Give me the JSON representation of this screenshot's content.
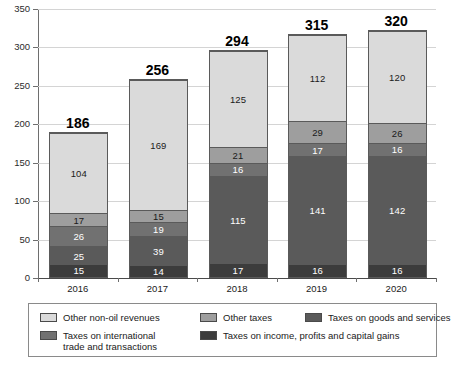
{
  "chart_data": {
    "type": "bar",
    "title": "",
    "subtitle": "",
    "xlabel": "",
    "ylabel": "",
    "stacked": true,
    "grid": true,
    "legend_position": "bottom",
    "ylim": [
      0,
      350
    ],
    "ytick_step": 50,
    "yticks": [
      "0",
      "50",
      "100",
      "150",
      "200",
      "250",
      "300",
      "350"
    ],
    "categories": [
      "2016",
      "2017",
      "2018",
      "2019",
      "2020"
    ],
    "totals": [
      "186",
      "256",
      "294",
      "315",
      "320"
    ],
    "series": [
      {
        "name": "Taxes on income, profits and capital gains",
        "color": "#3c3c3c",
        "label_color": "#ffffff",
        "values": [
          15,
          14,
          17,
          16,
          16
        ],
        "labels": [
          "15",
          "14",
          "17",
          "16",
          "16"
        ]
      },
      {
        "name": "Taxes on goods and services",
        "color": "#5a5a5a",
        "label_color": "#ffffff",
        "values": [
          25,
          39,
          115,
          141,
          142
        ],
        "labels": [
          "25",
          "39",
          "115",
          "141",
          "142"
        ]
      },
      {
        "name": "Taxes on international trade and transactions",
        "color": "#717171",
        "label_color": "#ffffff",
        "values": [
          26,
          19,
          16,
          17,
          16
        ],
        "labels": [
          "26",
          "19",
          "16",
          "17",
          "16"
        ]
      },
      {
        "name": "Other taxes",
        "color": "#9e9e9e",
        "label_color": "#1a1a1a",
        "values": [
          17,
          15,
          21,
          29,
          26
        ],
        "labels": [
          "17",
          "15",
          "21",
          "29",
          "26"
        ]
      },
      {
        "name": "Other non-oil revenues",
        "color": "#dadada",
        "label_color": "#1a1a1a",
        "values": [
          104,
          169,
          125,
          112,
          120
        ],
        "labels": [
          "104",
          "169",
          "125",
          "112",
          "120"
        ]
      }
    ]
  },
  "legend": {
    "entries": [
      {
        "label": "Other non-oil revenues",
        "color": "#dadada"
      },
      {
        "label": "Other taxes",
        "color": "#9e9e9e"
      },
      {
        "label": "Taxes on goods and services",
        "color": "#5a5a5a"
      },
      {
        "label": "Taxes on international\ntrade and transactions",
        "color": "#717171"
      },
      {
        "label": "Taxes on income, profits and capital gains",
        "color": "#3c3c3c"
      }
    ]
  }
}
